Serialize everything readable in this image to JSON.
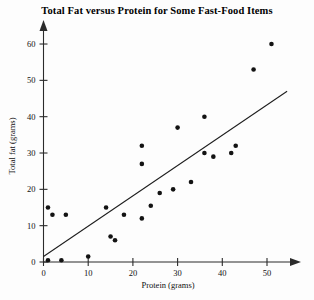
{
  "chart_data": {
    "type": "scatter",
    "title": "Total Fat versus Protein for Some Fast-Food Items",
    "xlabel": "Protein (grams)",
    "ylabel": "Total fat (grams)",
    "xlim": [
      0,
      57
    ],
    "ylim": [
      0,
      64
    ],
    "xticks": [
      0,
      10,
      20,
      30,
      40,
      50
    ],
    "yticks": [
      0,
      10,
      20,
      30,
      40,
      50,
      60
    ],
    "grid": false,
    "legend": null,
    "points": [
      {
        "x": 1,
        "y": 15
      },
      {
        "x": 2,
        "y": 13
      },
      {
        "x": 5,
        "y": 13
      },
      {
        "x": 1,
        "y": 0.5
      },
      {
        "x": 4,
        "y": 0.5
      },
      {
        "x": 10,
        "y": 1.5
      },
      {
        "x": 14,
        "y": 15
      },
      {
        "x": 15,
        "y": 7
      },
      {
        "x": 16,
        "y": 6
      },
      {
        "x": 18,
        "y": 13
      },
      {
        "x": 22,
        "y": 32
      },
      {
        "x": 22,
        "y": 27
      },
      {
        "x": 22,
        "y": 12
      },
      {
        "x": 24,
        "y": 15.5
      },
      {
        "x": 26,
        "y": 19
      },
      {
        "x": 29,
        "y": 20
      },
      {
        "x": 30,
        "y": 37
      },
      {
        "x": 33,
        "y": 22
      },
      {
        "x": 36,
        "y": 40
      },
      {
        "x": 36,
        "y": 30
      },
      {
        "x": 38,
        "y": 29
      },
      {
        "x": 42,
        "y": 30
      },
      {
        "x": 43,
        "y": 32
      },
      {
        "x": 47,
        "y": 53
      },
      {
        "x": 51,
        "y": 60
      }
    ],
    "trend_line": {
      "x0": 0,
      "y0": 1.5,
      "x1": 54.5,
      "y1": 47
    }
  }
}
